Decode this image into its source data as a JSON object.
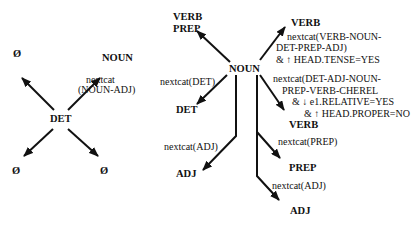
{
  "left_diagram": {
    "center": "DET",
    "nodes": {
      "top_left": "Ø",
      "top_right": "NOUN",
      "bottom_left": "Ø",
      "bottom_right": "Ø"
    },
    "labels": {
      "top_right_line1": "nextcat",
      "top_right_line2": "(NOUN-ADJ)"
    }
  },
  "right_diagram": {
    "center": "NOUN",
    "nodes": {
      "verb_prep_line1": "VERB",
      "verb_prep_line2": "PREP",
      "verb_top": "VERB",
      "det": "DET",
      "adj_left": "ADJ",
      "verb_mid": "VERB",
      "prep": "PREP",
      "adj_bottom": "ADJ"
    },
    "labels": {
      "verb_top_line1": "nextcat(VERB-NOUN-",
      "verb_top_line2": "DET-PREP-ADJ)",
      "verb_top_line3": "& ↑ HEAD.TENSE=YES",
      "det": "nextcat(DET)",
      "adj_left": "nextcat(ADJ)",
      "verb_mid_line1": "nextcat(DET-ADJ-NOUN-",
      "verb_mid_line2": "PREP-VERB-CHEREL",
      "verb_mid_line3": "& ↓ e1.RELATIVE=YES",
      "verb_mid_line4": "& ↑ HEAD.PROPER=NO",
      "prep": "nextcat(PREP)",
      "adj_bottom": "nextcat(ADJ)"
    }
  },
  "colors": {
    "ink": "#111111",
    "background": "#ffffff"
  }
}
